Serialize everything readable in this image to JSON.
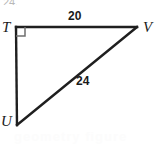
{
  "figure": {
    "kind": "right-triangle-diagram",
    "name": "Right triangle TUV",
    "stroke_color": "#1f1f1f",
    "background_color": "#ffffff",
    "label_color": "#1a1a1a"
  },
  "vertices": {
    "t": {
      "label": "T",
      "x": 16,
      "y": 27
    },
    "v": {
      "label": "V",
      "x": 137,
      "y": 27
    },
    "u": {
      "label": "U",
      "x": 17,
      "y": 125
    }
  },
  "right_angle": {
    "at_vertex": "T",
    "marker": "square",
    "size": 8
  },
  "sides": [
    {
      "name": "TV",
      "label": "20",
      "value": 20,
      "from": "T",
      "to": "V",
      "kind": "leg"
    },
    {
      "name": "UV",
      "label": "24",
      "value": 24,
      "from": "U",
      "to": "V",
      "kind": "hypotenuse"
    },
    {
      "name": "TU",
      "label": "",
      "value": null,
      "from": "T",
      "to": "U",
      "kind": "leg"
    }
  ],
  "artifacts": {
    "top_cut_text": "24.",
    "bottom_watermark_text": "geometry figure"
  }
}
